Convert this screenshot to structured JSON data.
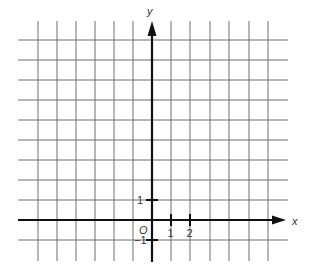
{
  "diagram": {
    "type": "coordinate-grid",
    "x_axis_label": "x",
    "y_axis_label": "y",
    "origin_label": "O",
    "x_tick_labels": [
      "1",
      "2"
    ],
    "y_tick_labels": [
      "1",
      "−1"
    ],
    "grid": {
      "x_lines": [
        38,
        57,
        76,
        95,
        114,
        133,
        171,
        190,
        210,
        229,
        249,
        268
      ],
      "y_lines": [
        40,
        60,
        80,
        100,
        120,
        140,
        160,
        180,
        200,
        240
      ],
      "x_extent": [
        18,
        288
      ],
      "y_extent": [
        21,
        261
      ]
    },
    "axes": {
      "x_axis_y": 220,
      "y_axis_x": 152,
      "x_arrow_end": 286,
      "y_arrow_end": 21
    },
    "colors": {
      "grid": "#6e6e6e",
      "axis": "#111111",
      "background": "#ffffff"
    }
  }
}
